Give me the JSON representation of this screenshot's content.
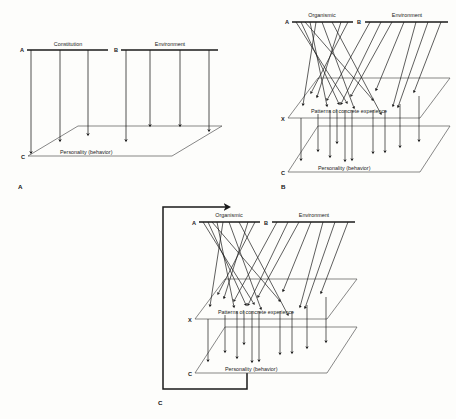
{
  "figure": {
    "background_color": "#fdfdfb",
    "ink_color": "#1a1a1a",
    "width": 456,
    "height": 419
  },
  "panels": [
    {
      "caption": "A",
      "caption_pos": [
        18,
        188
      ],
      "origin": [
        0,
        0
      ],
      "type": "direct-determination",
      "bars": [
        {
          "node": "A",
          "node_pos": [
            20,
            52
          ],
          "label": "Constitution",
          "label_pos": [
            68,
            46
          ],
          "x1": 27,
          "x2": 108,
          "y": 50,
          "drop_count": 3,
          "drops_x": [
            31,
            60,
            88
          ]
        },
        {
          "node": "B",
          "node_pos": [
            114,
            52
          ],
          "label": "Environment",
          "label_pos": [
            167,
            46
          ],
          "x1": 121,
          "x2": 218,
          "y": 50,
          "drop_count": 4,
          "drops_x": [
            126,
            150,
            180,
            209
          ]
        }
      ],
      "plane": {
        "name": "personality-plane",
        "label": "Personality (behavior)",
        "label_pos": [
          60,
          161
        ],
        "node": "C",
        "node_pos": [
          22,
          159
        ],
        "points": "28,156 78,126 222,126 172,156",
        "front_left": [
          28,
          156
        ],
        "back_left": [
          78,
          126
        ]
      },
      "arrows": [
        {
          "x": 31,
          "y_from": 50,
          "y_to": 154
        },
        {
          "x": 60,
          "y_from": 50,
          "y_to": 143
        },
        {
          "x": 88,
          "y_from": 50,
          "y_to": 137
        },
        {
          "x": 126,
          "y_from": 50,
          "y_to": 143
        },
        {
          "x": 150,
          "y_from": 50,
          "y_to": 127
        },
        {
          "x": 180,
          "y_from": 50,
          "y_to": 127
        },
        {
          "x": 209,
          "y_from": 50,
          "y_to": 133
        }
      ]
    },
    {
      "caption": "B",
      "caption_pos": [
        281,
        188
      ],
      "origin": [
        255,
        0
      ],
      "type": "mediated-determination",
      "bars": [
        {
          "node": "A",
          "node_pos": [
            285,
            24
          ],
          "label": "Organismic",
          "label_pos": [
            320,
            16
          ],
          "x1": 292,
          "x2": 353,
          "y": 22
        },
        {
          "node": "B",
          "node_pos": [
            357,
            24
          ],
          "label": "Environment",
          "label_pos": [
            405,
            16
          ],
          "x1": 365,
          "x2": 448,
          "y": 22
        }
      ],
      "middle_plane": {
        "name": "experience-plane",
        "label": "Patterns of concrete experience",
        "label_pos": [
          311,
          113
        ],
        "node": "X",
        "node_pos": [
          282,
          121
        ],
        "points": "288,118 318,78 450,78 420,118"
      },
      "bottom_plane": {
        "name": "personality-plane",
        "label": "Personality (behavior)",
        "label_pos": [
          318,
          175
        ],
        "node": "C",
        "node_pos": [
          282,
          175
        ],
        "points": "288,172 318,126 450,126 420,172"
      },
      "top_to_middle_count": 16,
      "middle_to_bottom_count": 10
    },
    {
      "caption": "C",
      "caption_pos": [
        158,
        404
      ],
      "origin": [
        155,
        200
      ],
      "type": "feedback-determination",
      "bars": [
        {
          "node": "A",
          "node_pos": [
            192,
            225
          ],
          "label": "Organismic",
          "label_pos": [
            228,
            215
          ],
          "x1": 199,
          "x2": 260,
          "y": 222
        },
        {
          "node": "B",
          "node_pos": [
            264,
            225
          ],
          "label": "Environment",
          "label_pos": [
            312,
            215
          ],
          "x1": 272,
          "x2": 355,
          "y": 222
        }
      ],
      "middle_plane": {
        "name": "experience-plane",
        "label": "Patterns of concrete experience",
        "label_pos": [
          218,
          314
        ],
        "node": "X",
        "node_pos": [
          189,
          322
        ],
        "points": "195,319 225,279 357,279 327,319"
      },
      "bottom_plane": {
        "name": "personality-plane",
        "label": "Personality (behavior)",
        "label_pos": [
          225,
          376
        ],
        "node": "C",
        "node_pos": [
          189,
          376
        ],
        "points": "195,373 225,327 357,327 327,373"
      },
      "feedback_loop": {
        "name": "feedback-path",
        "path": "M 247,373 L 247,389 L 163,389 L 163,207 L 231,207",
        "arrow_at": [
          231,
          207
        ],
        "description": "return arrow from personality plane to organismic bar"
      },
      "top_to_middle_count": 16,
      "middle_to_bottom_count": 10
    }
  ],
  "labels_glossary": {
    "constitution": "Constitution",
    "environment": "Environment",
    "organismic": "Organismic",
    "patterns": "Patterns of concrete experience",
    "personality": "Personality (behavior)",
    "node_a": "A",
    "node_b": "B",
    "node_c": "C",
    "node_x": "X"
  }
}
